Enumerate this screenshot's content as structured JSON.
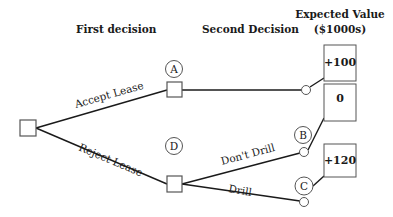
{
  "headers": {
    "first": "First decision",
    "second": "Second Decision",
    "ev_line1": "Expected Value",
    "ev_line2": "($1000s)"
  },
  "branches": {
    "accept": "Accept Lease",
    "reject": "Reject Lease",
    "dont_drill": "Don't Drill",
    "drill": "Drill"
  },
  "nodes": {
    "A": "A",
    "B": "B",
    "C": "C",
    "D": "D"
  },
  "values": {
    "accept": "+100",
    "dont_drill": "0",
    "drill": "+120"
  },
  "colors": {
    "stroke": "#1a1a1a",
    "box_stroke": "#555555",
    "background": "#ffffff"
  }
}
